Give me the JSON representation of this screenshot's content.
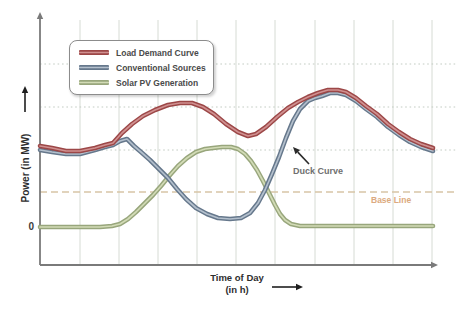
{
  "axes": {
    "y_label": "Power (in MW)",
    "x_label": "Time of Day",
    "x_label_sub": "(in h)",
    "y_zero_tick": "0"
  },
  "annotations": {
    "duck_curve_label": "Duck Curve",
    "duck_curve_color": "#6f6f6f",
    "base_line_label": "Base Line",
    "base_line_color": "#dcaa80"
  },
  "legend": {
    "border_color": "#8c8c8c",
    "text_color": "#4a4a4a"
  },
  "chart_data": {
    "type": "line",
    "title": "",
    "xlabel": "Time of Day (in h)",
    "ylabel": "Power (in MW)",
    "x_ticks": [],
    "y_ticks": [
      "0"
    ],
    "legend_position": "top-left",
    "grid": {
      "vertical_x_px": [
        80,
        119,
        158,
        197,
        236,
        275,
        315,
        354,
        393,
        432
      ],
      "vertical_top_px": 20,
      "vertical_bottom_px": 265,
      "vertical_color": "#d6dbd4",
      "horizontal_y_px": [
        64,
        107,
        150
      ],
      "horizontal_left_px": 40,
      "horizontal_right_px": 456,
      "horizontal_color": "#c3ccc3"
    },
    "baseline": {
      "y_px": 192,
      "color": "#d7c5a7",
      "label": "Base Line"
    },
    "axis_style": {
      "color": "#7a7a7a",
      "x0": 40,
      "y0": 265,
      "x_arrow_tip": 438,
      "y_arrow_tip": 12
    },
    "series": [
      {
        "name": "Solar PV Generation",
        "color_dark": "#98a67c",
        "color_light": "#d2dbb6",
        "points_px": [
          [
            40,
            227
          ],
          [
            60,
            227
          ],
          [
            80,
            227
          ],
          [
            100,
            227
          ],
          [
            112,
            226
          ],
          [
            120,
            224
          ],
          [
            128,
            219
          ],
          [
            136,
            212
          ],
          [
            145,
            203
          ],
          [
            153,
            195
          ],
          [
            161,
            186
          ],
          [
            170,
            175
          ],
          [
            178,
            166
          ],
          [
            187,
            158
          ],
          [
            196,
            152
          ],
          [
            205,
            149
          ],
          [
            213,
            148
          ],
          [
            222,
            147
          ],
          [
            231,
            147
          ],
          [
            238,
            149
          ],
          [
            245,
            154
          ],
          [
            251,
            161
          ],
          [
            257,
            170
          ],
          [
            263,
            181
          ],
          [
            269,
            193
          ],
          [
            275,
            205
          ],
          [
            280,
            214
          ],
          [
            285,
            220
          ],
          [
            291,
            224
          ],
          [
            300,
            226
          ],
          [
            330,
            226
          ],
          [
            370,
            226
          ],
          [
            400,
            226
          ],
          [
            433,
            226
          ]
        ]
      },
      {
        "name": "Conventional Sources",
        "color_dark": "#66788c",
        "color_light": "#b4c0cd",
        "points_px": [
          [
            40,
            150
          ],
          [
            52,
            152
          ],
          [
            66,
            154
          ],
          [
            80,
            154
          ],
          [
            95,
            150
          ],
          [
            105,
            147
          ],
          [
            113,
            145
          ],
          [
            120,
            141
          ],
          [
            127,
            139
          ],
          [
            134,
            146
          ],
          [
            141,
            152
          ],
          [
            150,
            160
          ],
          [
            160,
            170
          ],
          [
            168,
            178
          ],
          [
            177,
            189
          ],
          [
            186,
            199
          ],
          [
            196,
            208
          ],
          [
            207,
            214
          ],
          [
            218,
            218
          ],
          [
            230,
            219
          ],
          [
            241,
            218
          ],
          [
            250,
            213
          ],
          [
            258,
            203
          ],
          [
            265,
            190
          ],
          [
            272,
            174
          ],
          [
            279,
            157
          ],
          [
            286,
            138
          ],
          [
            293,
            121
          ],
          [
            300,
            109
          ],
          [
            308,
            101
          ],
          [
            315,
            98
          ],
          [
            322,
            96
          ],
          [
            330,
            93
          ],
          [
            338,
            93
          ],
          [
            346,
            95
          ],
          [
            356,
            101
          ],
          [
            366,
            109
          ],
          [
            377,
            117
          ],
          [
            388,
            127
          ],
          [
            399,
            135
          ],
          [
            410,
            142
          ],
          [
            421,
            147
          ],
          [
            433,
            151
          ]
        ]
      },
      {
        "name": "Load Demand Curve",
        "color_dark": "#9c4747",
        "color_light": "#d09090",
        "points_px": [
          [
            40,
            146
          ],
          [
            52,
            148
          ],
          [
            66,
            151
          ],
          [
            80,
            151
          ],
          [
            95,
            148
          ],
          [
            105,
            145
          ],
          [
            113,
            143
          ],
          [
            122,
            133
          ],
          [
            132,
            124
          ],
          [
            143,
            116
          ],
          [
            155,
            110
          ],
          [
            168,
            105
          ],
          [
            180,
            103
          ],
          [
            192,
            103
          ],
          [
            203,
            107
          ],
          [
            214,
            114
          ],
          [
            226,
            124
          ],
          [
            238,
            132
          ],
          [
            248,
            136
          ],
          [
            256,
            134
          ],
          [
            266,
            127
          ],
          [
            277,
            117
          ],
          [
            288,
            108
          ],
          [
            298,
            102
          ],
          [
            308,
            97
          ],
          [
            318,
            93
          ],
          [
            328,
            90
          ],
          [
            338,
            90
          ],
          [
            346,
            92
          ],
          [
            356,
            98
          ],
          [
            366,
            106
          ],
          [
            377,
            114
          ],
          [
            388,
            124
          ],
          [
            399,
            132
          ],
          [
            410,
            139
          ],
          [
            421,
            144
          ],
          [
            433,
            148
          ]
        ]
      }
    ],
    "legend_order": [
      2,
      1,
      0
    ],
    "annotation_arrows": [
      {
        "name": "duck-curve-arrow",
        "from": [
          309,
          164
        ],
        "to": [
          293,
          147
        ],
        "color": "#2b2b2b",
        "width": 1.6
      },
      {
        "name": "y-axis-label-arrow",
        "from": [
          25,
          112
        ],
        "to": [
          25,
          86
        ],
        "color": "#1f1f1f",
        "width": 1.6
      },
      {
        "name": "x-axis-label-arrow",
        "from": [
          272,
          287
        ],
        "to": [
          303,
          287
        ],
        "color": "#1f1f1f",
        "width": 1.6
      }
    ]
  }
}
